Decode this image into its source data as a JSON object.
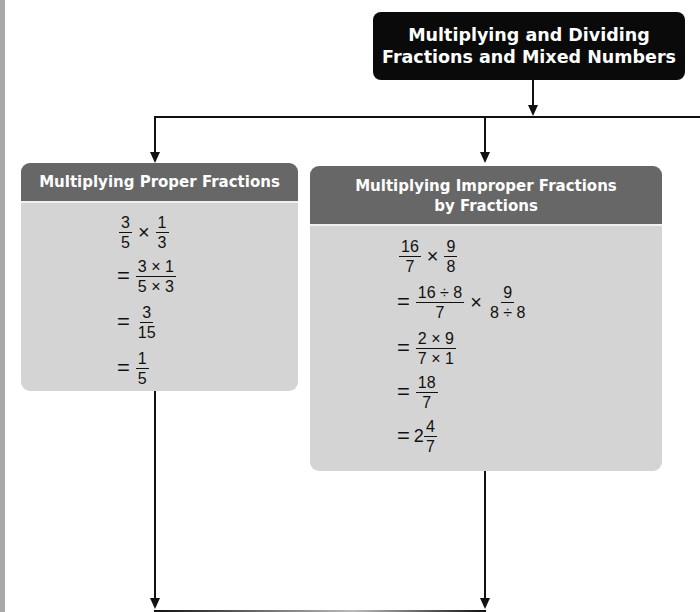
{
  "root": {
    "title_line1": "Multiplying and Dividing",
    "title_line2": "Fractions and Mixed Numbers"
  },
  "top_cut_text": "Chapter Wrap Up",
  "cards": [
    {
      "title": "Multiplying Proper Fractions",
      "steps": [
        {
          "prefix": "",
          "parts": [
            {
              "num": "3",
              "den": "5"
            },
            {
              "op": "×"
            },
            {
              "num": "1",
              "den": "3"
            }
          ]
        },
        {
          "prefix": "=",
          "parts": [
            {
              "num": "3 × 1",
              "den": "5 × 3"
            }
          ]
        },
        {
          "prefix": "=",
          "parts": [
            {
              "num": "3",
              "den": "15"
            }
          ]
        },
        {
          "prefix": "=",
          "parts": [
            {
              "num": "1",
              "den": "5"
            }
          ]
        }
      ]
    },
    {
      "title_line1": "Multiplying Improper Fractions",
      "title_line2": "by Fractions",
      "steps": [
        {
          "prefix": "",
          "parts": [
            {
              "num": "16",
              "den": "7"
            },
            {
              "op": "×"
            },
            {
              "num": "9",
              "den": "8"
            }
          ]
        },
        {
          "prefix": "=",
          "parts": [
            {
              "num": "16 ÷ 8",
              "den": "7"
            },
            {
              "op": "×"
            },
            {
              "num": "9",
              "den": "8 ÷ 8"
            }
          ]
        },
        {
          "prefix": "=",
          "parts": [
            {
              "num": "2 × 9",
              "den": "7 × 1"
            }
          ]
        },
        {
          "prefix": "=",
          "parts": [
            {
              "num": "18",
              "den": "7"
            }
          ]
        },
        {
          "prefix": "=",
          "whole": "2",
          "parts": [
            {
              "num": "4",
              "den": "7"
            }
          ]
        }
      ]
    }
  ],
  "colors": {
    "root_bg": "#0a0a0a",
    "card_header": "#676767",
    "card_body": "#d4d4d4",
    "connector": "#111111"
  }
}
